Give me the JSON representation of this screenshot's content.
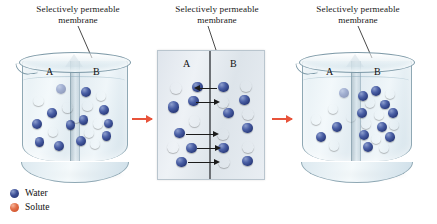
{
  "figure": {
    "colors": {
      "water": "#2c3d7e",
      "solute": "#cf4a22",
      "transfer_arrow": "#e8533a",
      "flow_arrow": "#1b1b1b",
      "glass": "#8fa8b4",
      "panel_background": "#e4eaf0"
    }
  },
  "captions": [
    {
      "line1": "Selectively permeable",
      "line2": "membrane"
    },
    {
      "line1": "Selectively permeable",
      "line2": "membrane"
    },
    {
      "line1": "Selectively permeable",
      "line2": "membrane"
    }
  ],
  "compartments": {
    "left": "A",
    "right": "B"
  },
  "panels": [
    {
      "id": "beaker-initial",
      "type": "beaker",
      "left_label": "A",
      "right_label": "B",
      "molecules": [
        {
          "type": "water",
          "x": 36,
          "y": 22,
          "r": 5.0,
          "faded": true
        },
        {
          "type": "solute",
          "x": 13,
          "y": 36,
          "r": 5.2
        },
        {
          "type": "water",
          "x": 27,
          "y": 50,
          "r": 4.8
        },
        {
          "type": "solute",
          "x": 43,
          "y": 44,
          "r": 5.4
        },
        {
          "type": "water",
          "x": 11,
          "y": 63,
          "r": 5.0
        },
        {
          "type": "solute",
          "x": 28,
          "y": 72,
          "r": 5.2
        },
        {
          "type": "water",
          "x": 14,
          "y": 84,
          "r": 4.8
        },
        {
          "type": "water",
          "x": 34,
          "y": 88,
          "r": 5.0
        },
        {
          "type": "water",
          "x": 46,
          "y": 64,
          "r": 4.6
        },
        {
          "type": "solute",
          "x": 52,
          "y": 56,
          "r": 5.0
        },
        {
          "type": "water",
          "x": 62,
          "y": 26,
          "r": 5.0
        },
        {
          "type": "solute",
          "x": 78,
          "y": 30,
          "r": 5.2
        },
        {
          "type": "solute",
          "x": 64,
          "y": 42,
          "r": 5.2
        },
        {
          "type": "water",
          "x": 81,
          "y": 47,
          "r": 5.0
        },
        {
          "type": "water",
          "x": 60,
          "y": 58,
          "r": 4.8
        },
        {
          "type": "solute",
          "x": 75,
          "y": 62,
          "r": 5.4
        },
        {
          "type": "solute",
          "x": 66,
          "y": 73,
          "r": 5.0
        },
        {
          "type": "water",
          "x": 57,
          "y": 83,
          "r": 5.0
        },
        {
          "type": "solute",
          "x": 72,
          "y": 86,
          "r": 5.2
        },
        {
          "type": "water",
          "x": 84,
          "y": 77,
          "r": 4.8
        },
        {
          "type": "water",
          "x": 86,
          "y": 62,
          "r": 4.6
        }
      ]
    },
    {
      "id": "magnified-membrane",
      "type": "magnified",
      "left_label": "A",
      "right_label": "B",
      "molecules": [
        {
          "type": "solute",
          "x": 14,
          "y": 17,
          "r": 6.0
        },
        {
          "type": "water",
          "x": 36,
          "y": 16,
          "r": 5.4
        },
        {
          "type": "water",
          "x": 32,
          "y": 30,
          "r": 5.4
        },
        {
          "type": "water",
          "x": 12,
          "y": 36,
          "r": 5.6
        },
        {
          "type": "solute",
          "x": 33,
          "y": 50,
          "r": 5.8
        },
        {
          "type": "water",
          "x": 18,
          "y": 62,
          "r": 5.4
        },
        {
          "type": "solute",
          "x": 11,
          "y": 76,
          "r": 5.8
        },
        {
          "type": "water",
          "x": 30,
          "y": 77,
          "r": 5.4
        },
        {
          "type": "water",
          "x": 20,
          "y": 91,
          "r": 5.4
        },
        {
          "type": "water",
          "x": 63,
          "y": 16,
          "r": 5.4
        },
        {
          "type": "solute",
          "x": 86,
          "y": 15,
          "r": 6.0
        },
        {
          "type": "solute",
          "x": 62,
          "y": 31,
          "r": 5.8
        },
        {
          "type": "water",
          "x": 84,
          "y": 29,
          "r": 5.4
        },
        {
          "type": "water",
          "x": 68,
          "y": 42,
          "r": 5.4
        },
        {
          "type": "solute",
          "x": 88,
          "y": 43,
          "r": 5.8
        },
        {
          "type": "water",
          "x": 87,
          "y": 57,
          "r": 5.4
        },
        {
          "type": "solute",
          "x": 62,
          "y": 63,
          "r": 5.8
        },
        {
          "type": "water",
          "x": 63,
          "y": 77,
          "r": 5.4
        },
        {
          "type": "solute",
          "x": 88,
          "y": 76,
          "r": 5.8
        },
        {
          "type": "water",
          "x": 87,
          "y": 90,
          "r": 5.4
        },
        {
          "type": "solute",
          "x": 63,
          "y": 91,
          "r": 5.8
        }
      ],
      "flow_arrows": [
        {
          "direction": "left",
          "y": 17,
          "x_start": 38,
          "x_end": 56
        },
        {
          "direction": "right",
          "y": 31,
          "x_start": 35,
          "x_end": 54
        },
        {
          "direction": "right",
          "y": 63,
          "x_start": 24,
          "x_end": 53
        },
        {
          "direction": "right",
          "y": 77,
          "x_start": 36,
          "x_end": 55
        },
        {
          "direction": "right",
          "y": 91,
          "x_start": 27,
          "x_end": 54
        }
      ]
    },
    {
      "id": "beaker-final",
      "type": "beaker",
      "left_label": "A",
      "right_label": "B",
      "molecules": [
        {
          "type": "solute",
          "x": 27,
          "y": 45,
          "r": 5.2
        },
        {
          "type": "water",
          "x": 38,
          "y": 27,
          "r": 5.0,
          "faded": true
        },
        {
          "type": "solute",
          "x": 10,
          "y": 58,
          "r": 5.4
        },
        {
          "type": "water",
          "x": 31,
          "y": 66,
          "r": 4.8
        },
        {
          "type": "water",
          "x": 15,
          "y": 78,
          "r": 5.0
        },
        {
          "type": "solute",
          "x": 28,
          "y": 88,
          "r": 5.2
        },
        {
          "type": "solute",
          "x": 45,
          "y": 55,
          "r": 5.0,
          "faded": true
        },
        {
          "type": "water",
          "x": 57,
          "y": 30,
          "r": 5.0
        },
        {
          "type": "water",
          "x": 70,
          "y": 24,
          "r": 5.0
        },
        {
          "type": "solute",
          "x": 84,
          "y": 28,
          "r": 5.2
        },
        {
          "type": "solute",
          "x": 64,
          "y": 38,
          "r": 5.4
        },
        {
          "type": "water",
          "x": 79,
          "y": 40,
          "r": 4.8
        },
        {
          "type": "water",
          "x": 56,
          "y": 50,
          "r": 5.0
        },
        {
          "type": "solute",
          "x": 73,
          "y": 52,
          "r": 5.2
        },
        {
          "type": "water",
          "x": 87,
          "y": 50,
          "r": 4.8
        },
        {
          "type": "solute",
          "x": 60,
          "y": 62,
          "r": 5.2
        },
        {
          "type": "water",
          "x": 76,
          "y": 66,
          "r": 5.0
        },
        {
          "type": "solute",
          "x": 88,
          "y": 64,
          "r": 5.0
        },
        {
          "type": "water",
          "x": 58,
          "y": 76,
          "r": 5.0
        },
        {
          "type": "solute",
          "x": 70,
          "y": 80,
          "r": 5.2
        },
        {
          "type": "water",
          "x": 84,
          "y": 78,
          "r": 4.8
        },
        {
          "type": "water",
          "x": 62,
          "y": 89,
          "r": 5.0
        },
        {
          "type": "solute",
          "x": 78,
          "y": 90,
          "r": 5.2
        }
      ]
    }
  ],
  "transfer_arrows": [
    {
      "id": "arrow-1-2"
    },
    {
      "id": "arrow-2-3"
    }
  ],
  "legend": {
    "items": [
      {
        "label": "Water",
        "color": "#2c3d7e",
        "key": "water"
      },
      {
        "label": "Solute",
        "color": "#cf4a22",
        "key": "solute"
      }
    ]
  }
}
